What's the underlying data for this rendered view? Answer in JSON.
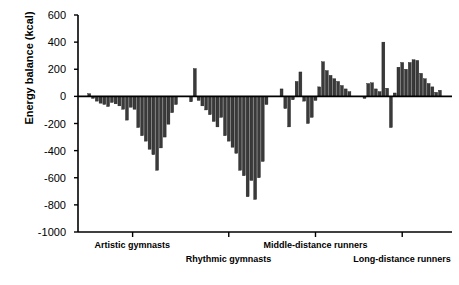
{
  "chart_data": {
    "type": "bar",
    "title": "",
    "xlabel": "",
    "ylabel": "Energy balance (kcal)",
    "ylim": [
      -1000,
      600
    ],
    "yticks": [
      600,
      400,
      200,
      0,
      -200,
      -400,
      -600,
      -800,
      -1000
    ],
    "ytick_labels": [
      "600",
      "400",
      "200",
      "0",
      "-200",
      "-400",
      "-600",
      "-800",
      "-1000"
    ],
    "grid": false,
    "legend": "none",
    "zero_line": 0,
    "groups": [
      {
        "name": "Artistic gymnasts",
        "label": "Artistic gymnasts",
        "values": [
          20,
          -15,
          -35,
          -50,
          -60,
          -75,
          -45,
          -55,
          -70,
          -95,
          -175,
          -80,
          -95,
          -230,
          -290,
          -330,
          -390,
          -430,
          -545,
          -380,
          -300,
          -205,
          -120,
          -60
        ]
      },
      {
        "name": "Rhythmic gymnasts",
        "label": "Rhythmic gymnasts",
        "values": [
          -40,
          205,
          -30,
          -70,
          -100,
          -135,
          -185,
          -225,
          -155,
          -290,
          -330,
          -375,
          -420,
          -545,
          -585,
          -740,
          -620,
          -760,
          -600,
          -480,
          -60
        ]
      },
      {
        "name": "Middle-distance runners",
        "label": "Middle-distance runners",
        "values": [
          55,
          -90,
          -225,
          -25,
          110,
          180,
          -35,
          -200,
          -155,
          -30,
          70,
          255,
          190,
          155,
          130,
          110,
          80,
          55,
          35
        ]
      },
      {
        "name": "Long-distance runners",
        "label": "Long-distance runners",
        "values": [
          -15,
          95,
          100,
          55,
          35,
          400,
          60,
          -230,
          25,
          215,
          250,
          200,
          250,
          270,
          265,
          170,
          130,
          95,
          70,
          30,
          45
        ]
      }
    ],
    "series_color": "#3a3a3a",
    "axis_color": "#000000"
  },
  "axis": {
    "ylabel": "Energy balance (kcal)"
  }
}
